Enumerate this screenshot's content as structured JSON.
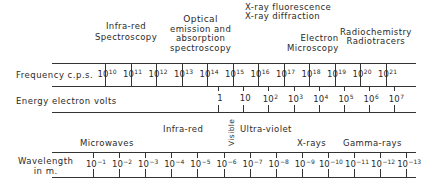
{
  "top_labels": {
    "infrared_spectroscopy": [
      "Infra-red",
      "Spectroscopy"
    ],
    "optical": [
      "Optical",
      "emission and",
      "absorption",
      "spectroscopy"
    ],
    "xray": [
      "X-ray fluorescence",
      "X-ray diffraction"
    ],
    "electron_microscopy": [
      "Electron",
      "Microscopy"
    ],
    "radio": [
      "Radiochemistry",
      "Radiotracers"
    ]
  },
  "rows": {
    "frequency_label": "Frequency c.p.s.",
    "energy_label": "Energy electron volts",
    "wavelength_label": [
      "Wavelength",
      "in m."
    ]
  },
  "bands": {
    "microwaves": "Microwaves",
    "infrared": "Infra-red",
    "visible": "Visible",
    "ultraviolet": "Ultra-violet",
    "xrays": "X-rays",
    "gamma": "Gamma-rays"
  },
  "chart_data": {
    "type": "table",
    "frequency": {
      "base": "10",
      "exponents": [
        "10",
        "11",
        "12",
        "13",
        "14",
        "15",
        "16",
        "17",
        "18",
        "19",
        "20",
        "21"
      ]
    },
    "energy": {
      "values": [
        {
          "b": "1",
          "e": ""
        },
        {
          "b": "10",
          "e": ""
        },
        {
          "b": "10",
          "e": "2"
        },
        {
          "b": "10",
          "e": "3"
        },
        {
          "b": "10",
          "e": "4"
        },
        {
          "b": "10",
          "e": "5"
        },
        {
          "b": "10",
          "e": "6"
        },
        {
          "b": "10",
          "e": "7"
        }
      ]
    },
    "wavelength": {
      "base": "10",
      "exponents": [
        "−1",
        "−2",
        "−3",
        "−4",
        "−5",
        "−6",
        "−7",
        "−8",
        "−9",
        "−10",
        "−11",
        "−12",
        "−13"
      ]
    }
  }
}
